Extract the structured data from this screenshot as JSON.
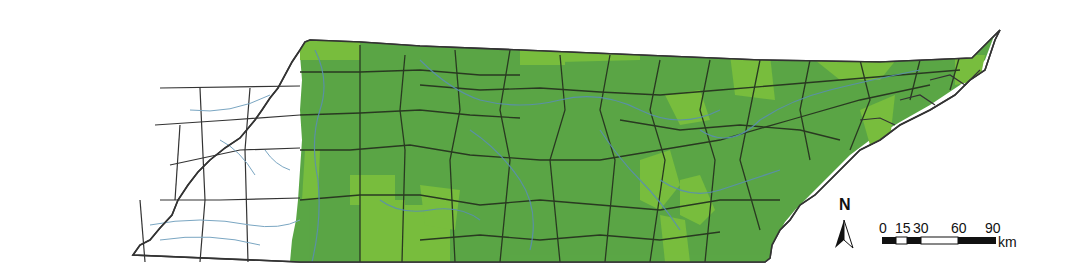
{
  "map": {
    "subject": "Tennessee counties",
    "colors": {
      "range_dark": "#5aa645",
      "range_light": "#78bd3e",
      "outside": "#ffffff",
      "county_border": "#2a3a22",
      "river": "#5a8fb0"
    }
  },
  "north_arrow": {
    "label": "N"
  },
  "scale_bar": {
    "ticks": [
      "0",
      "15",
      "30",
      "60",
      "90"
    ],
    "unit": "km"
  }
}
